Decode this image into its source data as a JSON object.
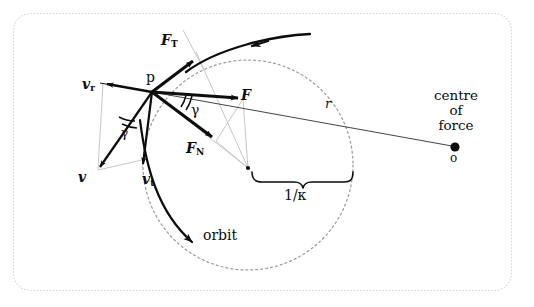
{
  "figure": {
    "background_color": "#ffffff",
    "border_color": "#d7d7d7",
    "ink_color": "#0d0d0d",
    "construction_line_color": "#b9b9b9",
    "dashed_circle_color": "#9a9a9a"
  },
  "labels": {
    "point_p": "p",
    "force_tangential": {
      "base": "F",
      "sub": "T"
    },
    "force_normal": {
      "base": "F",
      "sub": "N"
    },
    "force_total": {
      "base": "F",
      "sub": ""
    },
    "velocity_radial": {
      "base": "v",
      "sub": "r"
    },
    "velocity_tangential": {
      "base": "v",
      "sub": "t"
    },
    "velocity_total": {
      "base": "v",
      "sub": ""
    },
    "angle_upper": "γ",
    "angle_lower": "γ",
    "radius": "r",
    "curvature_radius": "1/κ",
    "orbit": "orbit",
    "centre_of_force_line1": "centre",
    "centre_of_force_line2": "of",
    "centre_of_force_line3": "force",
    "centre_of_force_point": "o"
  },
  "geometry": {
    "point_p": {
      "x": 152,
      "y": 92
    },
    "centre_of_force": {
      "x": 455,
      "y": 147
    },
    "osculating_circle": {
      "cx": 248,
      "cy": 165,
      "r": 105
    },
    "osculating_centre_dot": {
      "x": 248,
      "y": 168
    },
    "force_tip": {
      "x": 243,
      "y": 98
    },
    "force_normal_tip": {
      "x": 216,
      "y": 140
    },
    "force_tangential_tip": {
      "x": 196,
      "y": 58
    },
    "velocity_radial_tip": {
      "x": 103,
      "y": 82
    },
    "velocity_tangential_tip": {
      "x": 142,
      "y": 172
    },
    "velocity_total_tip": {
      "x": 96,
      "y": 172
    }
  }
}
